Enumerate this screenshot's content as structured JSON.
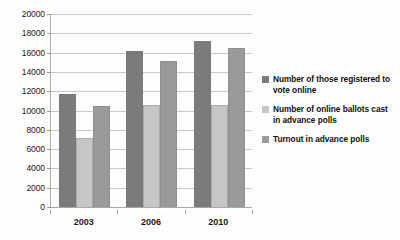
{
  "chart_data": {
    "type": "bar",
    "title": "",
    "subtitle": "",
    "xlabel": "",
    "ylabel": "",
    "categories": [
      "2003",
      "2006",
      "2010"
    ],
    "series": [
      {
        "name": "Number of those registered to vote online",
        "color": "#7b7b7b",
        "values": [
          11700,
          16200,
          17200
        ]
      },
      {
        "name": "Number of online ballots cast in advance polls",
        "color": "#c6c6c6",
        "values": [
          7200,
          10600,
          10550
        ]
      },
      {
        "name": "Turnout in advance polls",
        "color": "#9a9a9a",
        "values": [
          10500,
          15100,
          16450
        ]
      }
    ],
    "ylim": [
      0,
      20000
    ],
    "ytick_step": 2000,
    "yticks": [
      0,
      2000,
      4000,
      6000,
      8000,
      10000,
      12000,
      14000,
      16000,
      18000,
      20000
    ],
    "ytick_labels": [
      "0",
      "2000",
      "4000",
      "6000",
      "8000",
      "10000",
      "12000",
      "14000",
      "16000",
      "18000",
      "20000"
    ],
    "grid": "horizontal",
    "legend_position": "right",
    "background_color": "#fdfdfd",
    "gridline_color": "#c9c9c9",
    "axis_color": "#a8a8a8"
  },
  "legend": {
    "entries": [
      {
        "label": "Number of those registered to vote online",
        "color": "#7b7b7b"
      },
      {
        "label": "Number of online ballots cast in advance polls",
        "color": "#c6c6c6"
      },
      {
        "label": "Turnout in advance polls",
        "color": "#9a9a9a"
      }
    ]
  }
}
